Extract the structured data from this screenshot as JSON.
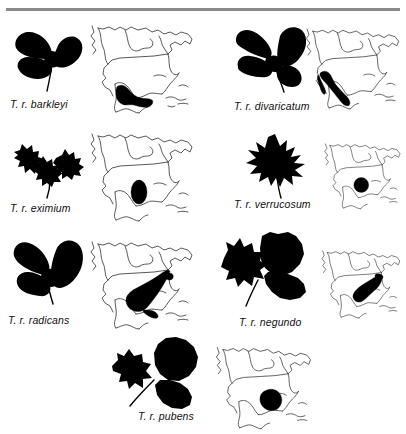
{
  "figure": {
    "divider_color": "#8a8a8a",
    "leaf_color": "#000000",
    "range_color": "#000000",
    "coastline_color": "#3b3b3b",
    "background_color": "#ffffff",
    "map_subject": "North America outline map"
  },
  "panels": [
    {
      "id": "barkleyi",
      "caption": "T. r. barkleyi",
      "leaf_name": "trifoliate-ovate-leaflets",
      "leaflets": 3,
      "range_description": "southern Mexico"
    },
    {
      "id": "divaricatum",
      "caption": "T. r. divaricatum",
      "leaf_name": "trifoliate-pointed-leaflets",
      "leaflets": 3,
      "range_description": "western Mexico and Baja California"
    },
    {
      "id": "eximium",
      "caption": "T. r. eximium",
      "leaf_name": "trifoliate-deeply-lobed-leaflets",
      "leaflets": 3,
      "range_description": "south-central Texas and northeastern Mexico"
    },
    {
      "id": "verrucosum",
      "caption": "T. r. verrucosum",
      "leaf_name": "simple-maple-like-lobed-leaf",
      "leaflets": 1,
      "range_description": "central Texas and Oklahoma"
    },
    {
      "id": "radicans",
      "caption": "T. r. radicans",
      "leaf_name": "trifoliate-broad-ovate-leaflets",
      "leaflets": 3,
      "range_description": "eastern United States, Appalachians to Gulf Coast"
    },
    {
      "id": "negundo",
      "caption": "T. r. negundo",
      "leaf_name": "trifoliate-coarsely-toothed-leaflets",
      "leaflets": 3,
      "range_description": "Midwestern United States, Ohio and Mississippi valleys"
    },
    {
      "id": "pubens",
      "caption": "T. r. pubens",
      "leaf_name": "trifoliate-broad-serrate-leaflets",
      "leaflets": 3,
      "range_description": "southeastern United States, lower Mississippi valley"
    }
  ]
}
